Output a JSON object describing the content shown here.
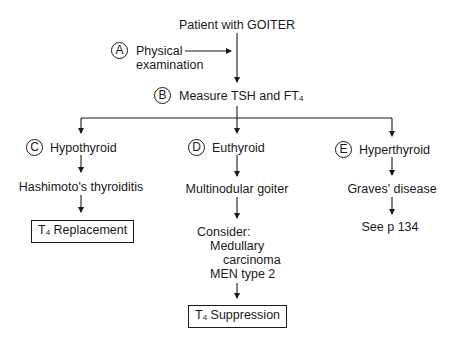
{
  "diagram": {
    "title": "Patient with GOITER",
    "step_a": {
      "marker": "A",
      "label_line1": "Physical",
      "label_line2": "examination"
    },
    "step_b": {
      "marker": "B",
      "label": "Measure TSH and FT",
      "label_sub": "4"
    },
    "branches": [
      {
        "marker": "C",
        "label": "Hypothyroid",
        "diagnosis": "Hashimoto's thyroiditis",
        "outcome": {
          "prefix": "T",
          "sub": "4",
          "text": " Replacement",
          "boxed": true
        }
      },
      {
        "marker": "D",
        "label": "Euthyroid",
        "diagnosis": "Multinodular goiter",
        "consider": {
          "heading": "Consider:",
          "line1": "Medullary",
          "line2": "carcinoma",
          "line3": "MEN type 2"
        },
        "outcome": {
          "prefix": "T",
          "sub": "4",
          "text": " Suppression",
          "boxed": true
        }
      },
      {
        "marker": "E",
        "label": "Hyperthyroid",
        "diagnosis": "Graves' disease",
        "outcome": {
          "text": "See p 134",
          "boxed": false
        }
      }
    ]
  }
}
